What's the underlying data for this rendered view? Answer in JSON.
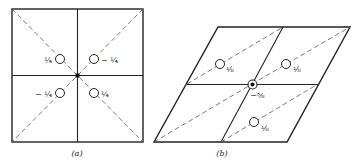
{
  "figure_a": {
    "caption": "(a)",
    "labels": {
      "top_left": "¼",
      "top_right": "− ¼",
      "bottom_left": "− ¼",
      "bottom_right": "¼"
    }
  },
  "figure_b": {
    "caption": "(b)",
    "labels": {
      "upper_left": "⅛",
      "upper_right": "⅛",
      "center": "−⅜",
      "lower": "⅛"
    }
  }
}
